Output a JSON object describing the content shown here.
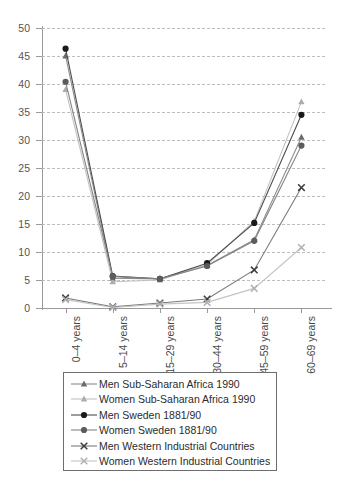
{
  "chart_data": {
    "type": "line",
    "title": "",
    "xlabel": "",
    "ylabel": "",
    "categories": [
      "0–4 years",
      "5–14 years",
      "15–29 years",
      "30–44 years",
      "45–59 years",
      "60–69 years"
    ],
    "ylim": [
      0,
      50
    ],
    "ytick_step": 5,
    "yticks": [
      0,
      5,
      10,
      15,
      20,
      25,
      30,
      35,
      40,
      45,
      50
    ],
    "grid": true,
    "legend_position": "bottom",
    "series": [
      {
        "name": "Men Sub-Saharan Africa 1990",
        "marker": "triangle",
        "color": "#6b6b6b",
        "line_color": "#8c8c8c",
        "values": [
          45.0,
          5.3,
          5.2,
          7.6,
          12.2,
          30.5
        ]
      },
      {
        "name": "Women Sub-Saharan Africa 1990",
        "marker": "triangle",
        "color": "#adadad",
        "line_color": "#c2c2c2",
        "values": [
          39.0,
          4.7,
          5.0,
          7.7,
          15.5,
          36.8
        ]
      },
      {
        "name": "Men Sweden 1881/90",
        "marker": "circle",
        "color": "#1a1a1a",
        "line_color": "#4d4d4d",
        "values": [
          46.3,
          5.7,
          5.2,
          8.0,
          15.2,
          34.5
        ]
      },
      {
        "name": "Women Sweden 1881/90",
        "marker": "circle",
        "color": "#5c5c5c",
        "line_color": "#858585",
        "values": [
          40.4,
          5.6,
          5.2,
          7.5,
          12.0,
          29.0
        ]
      },
      {
        "name": "Men Western Industrial Countries",
        "marker": "x",
        "color": "#3d3d3d",
        "line_color": "#7a7a7a",
        "values": [
          1.8,
          0.2,
          0.9,
          1.6,
          6.8,
          21.5
        ]
      },
      {
        "name": "Women Western Industrial Countries",
        "marker": "x",
        "color": "#b0b0b0",
        "line_color": "#c4c4c4",
        "values": [
          1.5,
          0.1,
          0.7,
          1.0,
          3.5,
          10.8
        ]
      }
    ]
  }
}
